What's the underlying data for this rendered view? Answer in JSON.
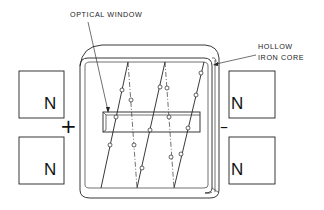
{
  "labels": {
    "optical_window": "OPTICAL WINDOW",
    "hollow_iron_core_line1": "HOLLOW",
    "hollow_iron_core_line2": "IRON CORE"
  },
  "magnets": {
    "left_top": "N",
    "left_bottom": "N",
    "right_top": "N",
    "right_bottom": "N"
  },
  "polarity": {
    "left": "+",
    "right": "–"
  },
  "colors": {
    "stroke": "#222222",
    "background": "#ffffff"
  }
}
